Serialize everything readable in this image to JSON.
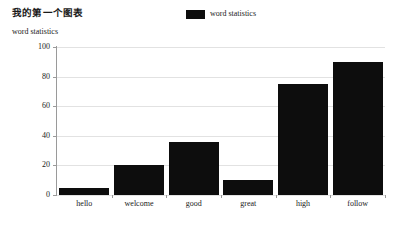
{
  "chart_data": {
    "type": "bar",
    "title": "我的第一个图表",
    "subtitle": "word statistics",
    "categories": [
      "hello",
      "welcome",
      "good",
      "great",
      "high",
      "follow"
    ],
    "values": [
      5,
      20,
      36,
      10,
      75,
      90
    ],
    "series": [
      {
        "name": "word statistics",
        "values": [
          5,
          20,
          36,
          10,
          75,
          90
        ],
        "color": "#0d0d0d"
      }
    ],
    "xlabel": "",
    "ylabel": "word statistics",
    "ylim": [
      0,
      100
    ],
    "yticks": [
      0,
      20,
      40,
      60,
      80,
      100
    ],
    "ytick_labels": [
      "0",
      "20",
      "40",
      "60",
      "80",
      "100"
    ],
    "grid": true,
    "grid_axis": "y",
    "legend": {
      "position": "top-center",
      "entries": [
        {
          "label": "word statistics",
          "color": "#0d0d0d"
        }
      ]
    },
    "background": "#ffffff",
    "axis_color": "#9a9a9a",
    "grid_color": "#e2e2e2"
  }
}
